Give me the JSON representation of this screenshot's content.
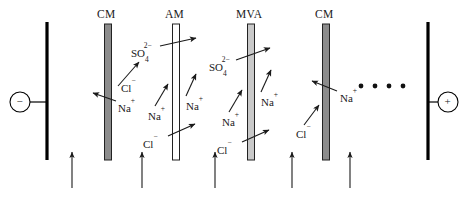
{
  "figure": {
    "type": "electrodialysis-cell-schematic",
    "title": "",
    "background": "#ffffff",
    "width": 462,
    "height": 202
  },
  "electrodes": [
    {
      "name": "cathode",
      "sign": "−",
      "label": "−",
      "x": 47,
      "top": 22,
      "bottom": 160,
      "color": "#000000",
      "terminal_cx": 20,
      "terminal_cy": 102,
      "terminal_r": 10
    },
    {
      "name": "anode",
      "sign": "+",
      "label": "+",
      "x": 428,
      "top": 22,
      "bottom": 160,
      "color": "#000000",
      "terminal_cx": 448,
      "terminal_cy": 102,
      "terminal_r": 10
    }
  ],
  "membranes": [
    {
      "id": "cm1",
      "label": "CM",
      "type": "cation-exchange",
      "x": 108,
      "top": 24,
      "bottom": 160,
      "width": 7,
      "fill": "#8c8c8c",
      "stroke": "#222222",
      "label_x": 97,
      "label_y": 9
    },
    {
      "id": "am1",
      "label": "AM",
      "type": "anion-exchange",
      "x": 176,
      "top": 24,
      "bottom": 160,
      "width": 7,
      "fill": "#ffffff",
      "stroke": "#222222",
      "label_x": 165,
      "label_y": 9
    },
    {
      "id": "mva1",
      "label": "MVA",
      "type": "monovalent-anion-selective",
      "x": 251,
      "top": 24,
      "bottom": 160,
      "width": 7,
      "fill": "#c9c9c9",
      "stroke": "#222222",
      "label_x": 236,
      "label_y": 9
    },
    {
      "id": "cm2",
      "label": "CM",
      "type": "cation-exchange",
      "x": 326,
      "top": 24,
      "bottom": 160,
      "width": 7,
      "fill": "#8c8c8c",
      "stroke": "#222222",
      "label_x": 315,
      "label_y": 9
    }
  ],
  "ion_labels": [
    {
      "id": "cl-1",
      "species": "Cl",
      "charge": "−",
      "sub": "",
      "sup": "−",
      "x": 121,
      "y": 83
    },
    {
      "id": "na-1",
      "species": "Na",
      "charge": "+",
      "sub": "",
      "sup": "+",
      "x": 118,
      "y": 103
    },
    {
      "id": "so4-1",
      "species": "SO",
      "sub": "4",
      "sup": "2−",
      "x": 131,
      "y": 48
    },
    {
      "id": "na-2",
      "species": "Na",
      "sub": "",
      "sup": "+",
      "x": 148,
      "y": 111
    },
    {
      "id": "na-3",
      "species": "Na",
      "sub": "",
      "sup": "+",
      "x": 186,
      "y": 101
    },
    {
      "id": "cl-2",
      "species": "Cl",
      "sub": "",
      "sup": "−",
      "x": 143,
      "y": 139
    },
    {
      "id": "so4-2",
      "species": "SO",
      "sub": "4",
      "sup": "2−",
      "x": 209,
      "y": 62
    },
    {
      "id": "na-4",
      "species": "Na",
      "sub": "",
      "sup": "+",
      "x": 222,
      "y": 117
    },
    {
      "id": "na-5",
      "species": "Na",
      "sub": "",
      "sup": "+",
      "x": 261,
      "y": 97
    },
    {
      "id": "cl-3",
      "species": "Cl",
      "sub": "",
      "sup": "−",
      "x": 217,
      "y": 145
    },
    {
      "id": "na-6",
      "species": "Na",
      "sub": "",
      "sup": "+",
      "x": 340,
      "y": 93
    },
    {
      "id": "cl-4",
      "species": "Cl",
      "sub": "",
      "sup": "−",
      "x": 296,
      "y": 129
    }
  ],
  "ion_arrows": [
    {
      "id": "a1",
      "from": [
        118,
        86
      ],
      "to": [
        139,
        62
      ],
      "note": "Cl- toward anode"
    },
    {
      "id": "a2",
      "from": [
        116,
        101
      ],
      "to": [
        93,
        93
      ],
      "note": "Na+ through CM toward cathode"
    },
    {
      "id": "a3",
      "from": [
        155,
        106
      ],
      "to": [
        168,
        84
      ],
      "note": "Na+ up"
    },
    {
      "id": "a4",
      "from": [
        160,
        46
      ],
      "to": [
        196,
        38
      ],
      "note": "SO4 2- blocked / toward anode"
    },
    {
      "id": "a5",
      "from": [
        186,
        96
      ],
      "to": [
        196,
        74
      ],
      "note": "Na+"
    },
    {
      "id": "a6",
      "from": [
        168,
        136
      ],
      "to": [
        195,
        124
      ],
      "note": "Cl- through AM"
    },
    {
      "id": "a7",
      "from": [
        229,
        112
      ],
      "to": [
        242,
        90
      ],
      "note": "Na+"
    },
    {
      "id": "a8",
      "from": [
        236,
        60
      ],
      "to": [
        270,
        48
      ],
      "note": "SO4 2-"
    },
    {
      "id": "a9",
      "from": [
        261,
        92
      ],
      "to": [
        271,
        70
      ],
      "note": "Na+"
    },
    {
      "id": "a10",
      "from": [
        242,
        142
      ],
      "to": [
        269,
        130
      ],
      "note": "Cl- through MVA"
    },
    {
      "id": "a11",
      "from": [
        337,
        91
      ],
      "to": [
        312,
        81
      ],
      "note": "Na+ through CM toward cathode"
    },
    {
      "id": "a12",
      "from": [
        304,
        125
      ],
      "to": [
        319,
        105
      ],
      "note": "Cl-"
    }
  ],
  "flow_arrows": [
    {
      "id": "f1",
      "x": 72,
      "y_bottom": 188,
      "y_top": 152
    },
    {
      "id": "f2",
      "x": 142,
      "y_bottom": 188,
      "y_top": 152
    },
    {
      "id": "f3",
      "x": 215,
      "y_bottom": 188,
      "y_top": 152
    },
    {
      "id": "f4",
      "x": 292,
      "y_bottom": 188,
      "y_top": 152
    },
    {
      "id": "f5",
      "x": 350,
      "y_bottom": 188,
      "y_top": 152
    }
  ],
  "repeat_ellipsis": {
    "label": "repeating-cell-pairs",
    "dots": 4,
    "x_start": 361,
    "y": 86,
    "spacing": 14,
    "radius": 2.4,
    "color": "#111111"
  },
  "colors": {
    "electrode": "#000000",
    "cation_membrane": "#8c8c8c",
    "anion_membrane": "#ffffff",
    "mva_membrane": "#c9c9c9",
    "stroke": "#222222",
    "text": "#1a1a1a",
    "arrow": "#1a1a1a"
  }
}
